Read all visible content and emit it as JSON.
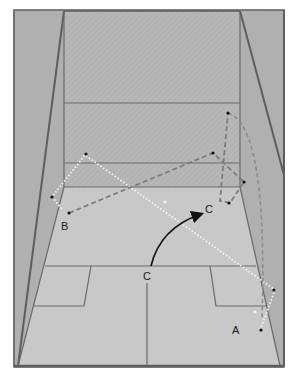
{
  "diagram": {
    "colors": {
      "wall": "#b4b4b4",
      "front_wall": "#b8b8b8",
      "floor": "#c6c6c6",
      "line": "#6a6a6a",
      "frame": "#5e5e5e",
      "path_white": "#f4f4f4",
      "path_dark": "#7a7a7a",
      "arrow_black": "#111111"
    },
    "labels": {
      "a": "A",
      "b": "B",
      "c_start": "C",
      "c_end": "C"
    },
    "paths": [
      {
        "id": "A",
        "style": "white-dotted",
        "description": "from A up to right wall, across to left side wall near B, then to front wall"
      },
      {
        "id": "B",
        "style": "dark-dashed",
        "description": "from B to front wall right, to right side wall, back down the right side"
      },
      {
        "id": "C",
        "style": "solid-black-arrow",
        "description": "curved movement from T position C forward-right to C"
      }
    ]
  }
}
